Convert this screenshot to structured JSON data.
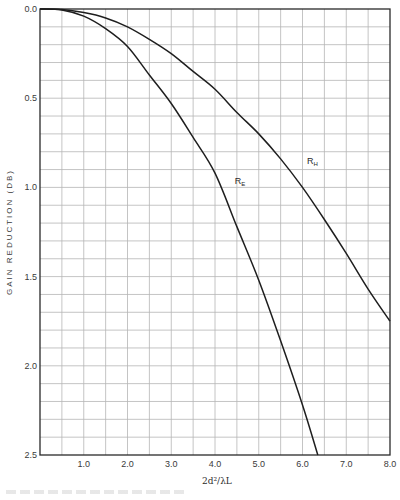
{
  "chart_data": {
    "type": "line",
    "title": "",
    "xlabel": "2d²/λL",
    "ylabel": "GAIN  REDUCTION  (DB)",
    "xlim": [
      0,
      8.0
    ],
    "ylim": [
      0,
      2.5
    ],
    "y_inverted": true,
    "grid": true,
    "grid_step": {
      "x": 0.5,
      "y": 0.1
    },
    "x_ticks": [
      "1.0",
      "2.0",
      "3.0",
      "4.0",
      "5.0",
      "6.0",
      "7.0",
      "8.0"
    ],
    "x_tick_values": [
      1,
      2,
      3,
      4,
      5,
      6,
      7,
      8
    ],
    "y_ticks": [
      "0.0",
      "0.5",
      "1.0",
      "1.5",
      "2.0",
      "2.5"
    ],
    "y_tick_values": [
      0,
      0.5,
      1.0,
      1.5,
      2.0,
      2.5
    ],
    "legend": "none (curves labeled inline)",
    "series": [
      {
        "name": "R_H",
        "label_main": "R",
        "label_sub": "H",
        "label_at": {
          "x": 6.1,
          "y": 0.87
        },
        "x": [
          0,
          0.5,
          1.0,
          1.5,
          2.0,
          2.5,
          3.0,
          3.5,
          4.0,
          4.5,
          5.0,
          5.5,
          6.0,
          6.5,
          7.0,
          7.5,
          8.0
        ],
        "values": [
          0,
          0.003,
          0.02,
          0.05,
          0.1,
          0.17,
          0.25,
          0.35,
          0.45,
          0.58,
          0.7,
          0.84,
          1.0,
          1.18,
          1.37,
          1.57,
          1.75
        ]
      },
      {
        "name": "R_E",
        "label_main": "R",
        "label_sub": "E",
        "label_at": {
          "x": 4.45,
          "y": 0.98
        },
        "x": [
          0,
          0.5,
          1.0,
          1.5,
          2.0,
          2.5,
          3.0,
          3.5,
          4.0,
          4.5,
          5.0,
          5.5,
          6.0,
          6.35
        ],
        "values": [
          0,
          0.005,
          0.04,
          0.11,
          0.21,
          0.37,
          0.53,
          0.72,
          0.92,
          1.22,
          1.52,
          1.86,
          2.22,
          2.5
        ]
      }
    ]
  }
}
